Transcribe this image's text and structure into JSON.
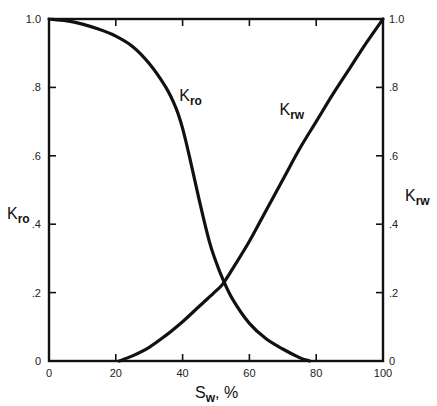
{
  "chart_data": {
    "type": "line",
    "title": "",
    "xlabel": "Sw, %",
    "xlabel_main": "S",
    "xlabel_sub": "w",
    "xlabel_suffix": ", %",
    "ylabel_left": "Kro",
    "ylabel_left_main": "K",
    "ylabel_left_sub": "ro",
    "ylabel_right": "Krw",
    "ylabel_right_main": "K",
    "ylabel_right_sub": "rw",
    "xlim": [
      0,
      100
    ],
    "ylim": [
      0,
      1.0
    ],
    "x_ticks": [
      0,
      20,
      40,
      60,
      80,
      100
    ],
    "x_tick_labels": [
      "0",
      "20",
      "40",
      "60",
      "80",
      "100"
    ],
    "y_ticks": [
      0,
      0.2,
      0.4,
      0.6,
      0.8,
      1.0
    ],
    "y_tick_labels_left": [
      "0",
      ".2",
      ".4",
      ".6",
      ".8",
      "1.0"
    ],
    "y_tick_labels_right": [
      "0",
      ".2",
      ".4",
      ".6",
      ".8",
      "1.0"
    ],
    "grid": false,
    "legend": "inline curve labels",
    "series": [
      {
        "name": "Kro",
        "label_main": "K",
        "label_sub": "ro",
        "label_position": {
          "x": 39,
          "y": 0.76
        },
        "x": [
          0,
          5,
          10,
          15,
          20,
          25,
          30,
          35,
          38,
          40,
          42,
          45,
          48,
          50,
          52,
          55,
          60,
          65,
          70,
          75,
          78
        ],
        "values": [
          1.0,
          0.995,
          0.985,
          0.97,
          0.95,
          0.92,
          0.87,
          0.8,
          0.74,
          0.68,
          0.6,
          0.47,
          0.35,
          0.29,
          0.24,
          0.18,
          0.11,
          0.065,
          0.035,
          0.01,
          0.0
        ]
      },
      {
        "name": "Krw",
        "label_main": "K",
        "label_sub": "rw",
        "label_position": {
          "x": 69,
          "y": 0.72
        },
        "x": [
          21,
          25,
          30,
          35,
          40,
          45,
          50,
          52,
          55,
          60,
          65,
          70,
          75,
          80,
          85,
          90,
          95,
          100
        ],
        "values": [
          0.0,
          0.015,
          0.04,
          0.075,
          0.115,
          0.16,
          0.205,
          0.225,
          0.27,
          0.35,
          0.44,
          0.53,
          0.62,
          0.7,
          0.78,
          0.855,
          0.93,
          1.0
        ]
      }
    ],
    "annotations": [
      "Curves intersect near Sw ≈ 52%, K ≈ 0.22"
    ]
  }
}
